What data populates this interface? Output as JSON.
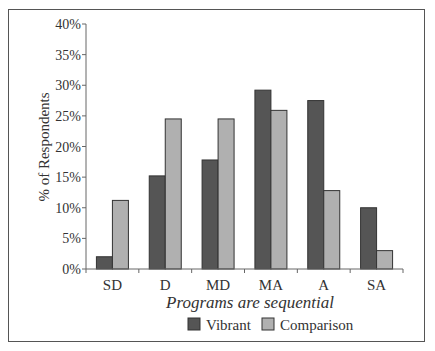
{
  "chart_data": {
    "type": "bar",
    "title": "",
    "xlabel": "Programs are sequential",
    "ylabel": "% of Respondents",
    "categories": [
      "SD",
      "D",
      "MD",
      "MA",
      "A",
      "SA"
    ],
    "series": [
      {
        "name": "Vibrant",
        "color": "#555555",
        "values": [
          2,
          15.2,
          17.8,
          29.2,
          27.5,
          10
        ]
      },
      {
        "name": "Comparison",
        "color": "#b0b0b0",
        "values": [
          11.2,
          24.5,
          24.5,
          25.9,
          12.8,
          3
        ]
      }
    ],
    "yticks": [
      "0%",
      "5%",
      "10%",
      "15%",
      "20%",
      "25%",
      "30%",
      "35%",
      "40%"
    ],
    "ylim": [
      0,
      40
    ],
    "grid": false,
    "legend_position": "bottom"
  },
  "legend": {
    "items": [
      {
        "label": "Vibrant",
        "color": "#555555"
      },
      {
        "label": "Comparison",
        "color": "#b0b0b0"
      }
    ]
  }
}
